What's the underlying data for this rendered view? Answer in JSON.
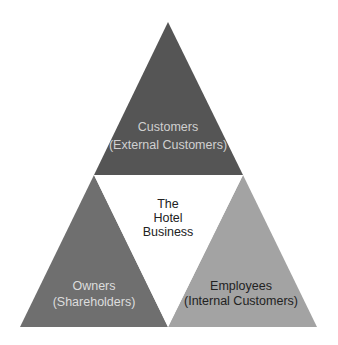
{
  "diagram": {
    "type": "triangle-framework",
    "center": {
      "label_lines": [
        "The",
        "Hotel",
        "Business"
      ],
      "fill": "#ffffff",
      "text_color": "#222222"
    },
    "top": {
      "title": "Customers",
      "subtitle": "(External Customers)",
      "fill": "#555555",
      "text_color": "#d0d0d0"
    },
    "bottom_left": {
      "title": "Owners",
      "subtitle": "(Shareholders)",
      "fill": "#6f6f6f",
      "text_color": "#dddddd"
    },
    "bottom_right": {
      "title": "Employees",
      "subtitle": "(Internal Customers)",
      "fill": "#a3a3a3",
      "text_color": "#222222"
    }
  }
}
